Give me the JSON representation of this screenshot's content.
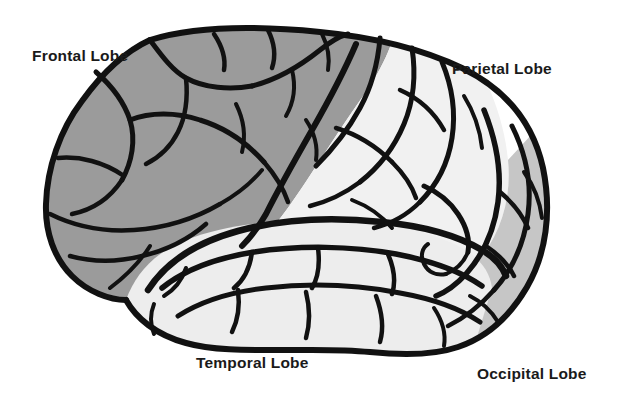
{
  "figure": {
    "view": "left lateral",
    "background_color": "#ffffff",
    "outline_color": "#111111"
  },
  "labels": {
    "frontal": "Frontal Lobe",
    "parietal": "Parietal Lobe",
    "temporal": "Temporal Lobe",
    "occipital": "Occipital Lobe"
  },
  "lobes": [
    {
      "name": "frontal",
      "label": "Frontal Lobe",
      "fill": "#9b9b9b",
      "shade": "medium gray",
      "label_position": "top-left"
    },
    {
      "name": "parietal",
      "label": "Parietal Lobe",
      "fill": "#f1f1f1",
      "shade": "white",
      "label_position": "top-right"
    },
    {
      "name": "temporal",
      "label": "Temporal Lobe",
      "fill": "#ededed",
      "shade": "white",
      "label_position": "bottom-center"
    },
    {
      "name": "occipital",
      "label": "Occipital Lobe",
      "fill": "#c6c6c6",
      "shade": "light gray",
      "label_position": "bottom-right"
    }
  ]
}
